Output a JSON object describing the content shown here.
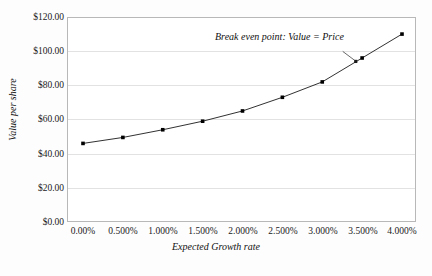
{
  "chart_data": {
    "type": "line",
    "title": "",
    "xlabel": "Expected Growth rate",
    "ylabel": "Value per share",
    "x": [
      0.0,
      0.5,
      1.0,
      1.5,
      2.0,
      2.5,
      3.0,
      3.5,
      4.0
    ],
    "categories": [
      "0.00%",
      "0.500%",
      "1.000%",
      "1.500%",
      "2.000%",
      "2.500%",
      "3.000%",
      "3.500%",
      "4.000%"
    ],
    "values": [
      46.0,
      49.5,
      54.0,
      59.0,
      65.0,
      73.0,
      82.0,
      96.0,
      110.0
    ],
    "series": [
      {
        "name": "Value per share",
        "values": [
          46.0,
          49.5,
          54.0,
          59.0,
          65.0,
          73.0,
          82.0,
          96.0,
          110.0
        ],
        "marker": "square",
        "color": "#000000"
      }
    ],
    "xlim": [
      0.0,
      4.0
    ],
    "ylim": [
      0.0,
      120.0
    ],
    "ytick_labels": [
      "$0.00",
      "$20.00",
      "$40.00",
      "$60.00",
      "$80.00",
      "$100.00",
      "$120.00"
    ],
    "ytick_values": [
      0,
      20,
      40,
      60,
      80,
      100,
      120
    ],
    "grid": "horizontal",
    "legend": "none",
    "annotations": [
      {
        "text": "Break even point: Value = Price",
        "points_to_x": 3.42,
        "points_to_y": 94.0
      }
    ],
    "break_even_marker": {
      "x": 3.42,
      "y": 94.0
    }
  },
  "axes": {
    "y_title": "Value per share",
    "x_title": "Expected Growth rate"
  },
  "annotation": {
    "break_even_text": "Break even point: Value = Price"
  }
}
